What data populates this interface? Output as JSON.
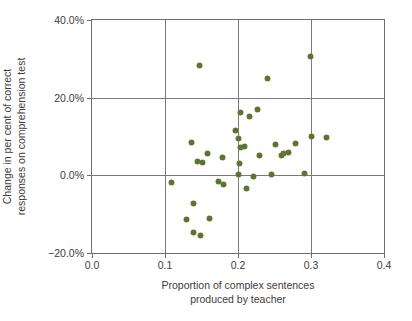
{
  "chart_data": {
    "type": "scatter",
    "title": "",
    "xlabel": "Proportion of complex sentences produced by teacher",
    "xlabel_line1": "Proportion of complex sentences",
    "xlabel_line2": "produced by teacher",
    "ylabel": "Change in per cent of correct responses on comprehension test",
    "ylabel_line1": "Change in per cent of correct",
    "ylabel_line2": "responses on comprehension test",
    "xlim": [
      0.0,
      0.4
    ],
    "ylim": [
      -20.0,
      40.0
    ],
    "grid": true,
    "legend": "none",
    "marker_color": "#5d7330",
    "axis_color": "#6f6f6f",
    "xticks": [
      {
        "value": 0.0,
        "label": "0.0"
      },
      {
        "value": 0.1,
        "label": "0.1"
      },
      {
        "value": 0.2,
        "label": "0.2"
      },
      {
        "value": 0.3,
        "label": "0.3"
      },
      {
        "value": 0.4,
        "label": "0.4"
      }
    ],
    "yticks": [
      {
        "value": 40.0,
        "label": "40.0%"
      },
      {
        "value": 20.0,
        "label": "20.0%"
      },
      {
        "value": 0.0,
        "label": "0.0%"
      },
      {
        "value": -20.0,
        "label": "−20.0%"
      }
    ],
    "points": [
      {
        "x": 0.147,
        "y": 28.3
      },
      {
        "x": 0.241,
        "y": 24.9
      },
      {
        "x": 0.299,
        "y": 30.6
      },
      {
        "x": 0.204,
        "y": 16.2
      },
      {
        "x": 0.216,
        "y": 15.2
      },
      {
        "x": 0.227,
        "y": 17.0
      },
      {
        "x": 0.197,
        "y": 11.5
      },
      {
        "x": 0.2,
        "y": 9.5
      },
      {
        "x": 0.204,
        "y": 7.2
      },
      {
        "x": 0.202,
        "y": 3.0
      },
      {
        "x": 0.2,
        "y": 0.3
      },
      {
        "x": 0.209,
        "y": 7.5
      },
      {
        "x": 0.23,
        "y": 5.0
      },
      {
        "x": 0.221,
        "y": -0.2
      },
      {
        "x": 0.212,
        "y": -3.4
      },
      {
        "x": 0.251,
        "y": 8.0
      },
      {
        "x": 0.262,
        "y": 5.5
      },
      {
        "x": 0.279,
        "y": 8.2
      },
      {
        "x": 0.3,
        "y": 10.0
      },
      {
        "x": 0.321,
        "y": 9.8
      },
      {
        "x": 0.26,
        "y": 5.0
      },
      {
        "x": 0.269,
        "y": 6.0
      },
      {
        "x": 0.291,
        "y": 0.5
      },
      {
        "x": 0.246,
        "y": 0.3
      },
      {
        "x": 0.136,
        "y": 8.4
      },
      {
        "x": 0.158,
        "y": 5.7
      },
      {
        "x": 0.144,
        "y": 3.5
      },
      {
        "x": 0.152,
        "y": 3.4
      },
      {
        "x": 0.179,
        "y": 4.5
      },
      {
        "x": 0.109,
        "y": -1.8
      },
      {
        "x": 0.173,
        "y": -1.6
      },
      {
        "x": 0.18,
        "y": -2.3
      },
      {
        "x": 0.139,
        "y": -7.2
      },
      {
        "x": 0.129,
        "y": -11.5
      },
      {
        "x": 0.161,
        "y": -11.0
      },
      {
        "x": 0.139,
        "y": -14.7
      },
      {
        "x": 0.148,
        "y": -15.6
      }
    ]
  }
}
